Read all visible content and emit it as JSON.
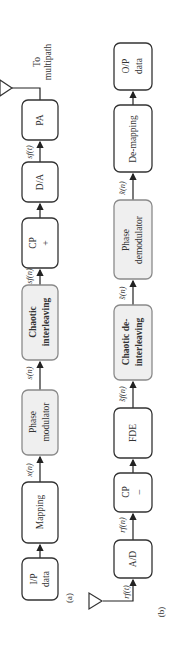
{
  "diagram": {
    "orientation": "rotated-90-ccw",
    "transmitter": {
      "caption": "(a)",
      "blocks": [
        {
          "id": "ip-data",
          "lines": [
            "I/P",
            "data"
          ],
          "shaded": false
        },
        {
          "id": "mapping",
          "lines": [
            "Mapping"
          ],
          "shaded": false
        },
        {
          "id": "phase-modulator",
          "lines": [
            "Phase",
            "modulator"
          ],
          "shaded": true
        },
        {
          "id": "chaotic-interleaving",
          "lines": [
            "Chaotic",
            "interleaving"
          ],
          "shaded": true,
          "bold": true
        },
        {
          "id": "cp-add",
          "lines": [
            "CP",
            "+"
          ],
          "shaded": false
        },
        {
          "id": "da",
          "lines": [
            "D/A"
          ],
          "shaded": false
        },
        {
          "id": "pa",
          "lines": [
            "PA"
          ],
          "shaded": false
        }
      ],
      "signals": [
        "x(n)",
        "s(n)",
        "s_f(n)",
        "s_f(t)"
      ],
      "output_label": [
        "To",
        "multipath"
      ]
    },
    "receiver": {
      "caption": "(b)",
      "blocks": [
        {
          "id": "ad",
          "lines": [
            "A/D"
          ],
          "shaded": false
        },
        {
          "id": "cp-remove",
          "lines": [
            "CP",
            "−"
          ],
          "shaded": false
        },
        {
          "id": "fde",
          "lines": [
            "FDE"
          ],
          "shaded": false
        },
        {
          "id": "chaotic-deinterleaving",
          "lines": [
            "Chaotic de-",
            "interleaving"
          ],
          "shaded": true,
          "bold": true
        },
        {
          "id": "phase-demodulator",
          "lines": [
            "Phase",
            "demodulator"
          ],
          "shaded": true
        },
        {
          "id": "de-mapping",
          "lines": [
            "De-mapping"
          ],
          "shaded": false
        },
        {
          "id": "op-data",
          "lines": [
            "O/P",
            "data"
          ],
          "shaded": false
        }
      ],
      "signals": [
        "r_f(t)",
        "r_f(n)",
        "ŝ_f(n)",
        "ŝ(n)",
        "x̂(n)"
      ]
    },
    "labels": {
      "ip1": "I/P",
      "ip2": "data",
      "mapping": "Mapping",
      "pm1": "Phase",
      "pm2": "modulator",
      "ci1": "Chaotic",
      "ci2": "interleaving",
      "cpp1": "CP",
      "cpp2": "+",
      "da": "D/A",
      "pa": "PA",
      "to": "To",
      "multipath": "multipath",
      "sig_x": "x(n)",
      "sig_s": "s(n)",
      "sig_sf": "sf(n)",
      "sig_sft": "sf(t)",
      "cap_a": "(a)",
      "ad": "A/D",
      "cpm1": "CP",
      "cpm2": "–",
      "fde": "FDE",
      "cd1": "Chaotic de-",
      "cd2": "interleaving",
      "pd1": "Phase",
      "pd2": "demodulator",
      "dm": "De-mapping",
      "op1": "O/P",
      "op2": "data",
      "sig_rft": "rf(t)",
      "sig_rfn": "rf(n)",
      "sig_sfhat": "s̃f(n)",
      "sig_shat": "s̃(n)",
      "sig_xhat": "x̃(n)",
      "cap_b": "(b)"
    }
  }
}
